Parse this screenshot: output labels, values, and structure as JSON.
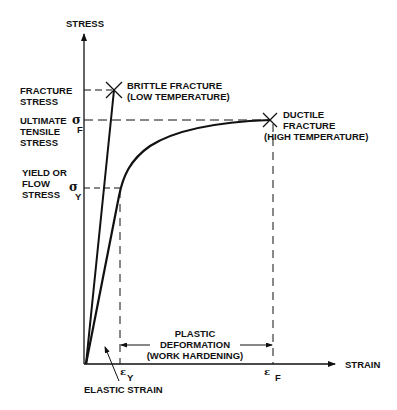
{
  "diagram": {
    "type": "stress-strain curve",
    "axes": {
      "y_label": "STRESS",
      "x_label": "STRAIN"
    },
    "stress_levels": {
      "fracture_stress": [
        "FRACTURE",
        "STRESS"
      ],
      "ultimate_tensile_stress": [
        "ULTIMATE",
        "TENSILE",
        "STRESS"
      ],
      "yield_stress": [
        "YIELD OR",
        "FLOW",
        "STRESS"
      ]
    },
    "symbols": {
      "sigma": "σ",
      "sigma_f_sub": "F",
      "sigma_y_sub": "Y",
      "epsilon": "ε",
      "epsilon_y_sub": "Y",
      "epsilon_f_sub": "F"
    },
    "annotations": {
      "brittle_fracture": [
        "BRITTLE FRACTURE",
        "(LOW TEMPERATURE)"
      ],
      "ductile_fracture": [
        "DUCTILE",
        "FRACTURE",
        "(HIGH TEMPERATURE)"
      ],
      "plastic_deformation": [
        "PLASTIC",
        "DEFORMATION",
        "(WORK HARDENING)"
      ],
      "elastic_strain": "ELASTIC STRAIN"
    },
    "colors": {
      "line": "#111111",
      "background": "#ffffff"
    }
  }
}
